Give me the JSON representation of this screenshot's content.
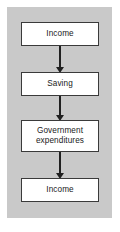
{
  "figure": {
    "type": "flow-diagram",
    "orientation": "vertical",
    "panel_color": "#c9c9c9",
    "node_fill": "#ffffff",
    "node_border_color": "#3a3a3a",
    "arrow_color": "#202020",
    "background_color": "#ffffff"
  },
  "nodes": [
    {
      "id": "node-1",
      "label": "Income"
    },
    {
      "id": "node-2",
      "label": "Saving"
    },
    {
      "id": "node-3",
      "label": "Government\nexpenditures"
    },
    {
      "id": "node-4",
      "label": "Income"
    }
  ],
  "connectors": [
    {
      "id": "arrow-1",
      "from": "node-1",
      "to": "node-2",
      "shape": "down-arrow"
    },
    {
      "id": "arrow-2",
      "from": "node-2",
      "to": "node-3",
      "shape": "down-arrow"
    },
    {
      "id": "arrow-3",
      "from": "node-3",
      "to": "node-4",
      "shape": "down-arrow"
    }
  ]
}
